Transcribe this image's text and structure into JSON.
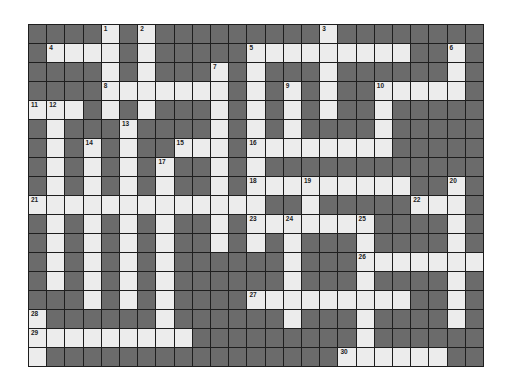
{
  "puzzle": {
    "columns": 25,
    "rows": 18,
    "colors": {
      "block": "#6b6b6b",
      "open": "#ececec",
      "line": "#1e1e1e",
      "number": "#222222"
    },
    "open_cells": [
      [
        4,
        6,
        16
      ],
      [
        1,
        2,
        3,
        4,
        6,
        12,
        13,
        14,
        15,
        16,
        17,
        18,
        19,
        20,
        23
      ],
      [
        4,
        6,
        10,
        12,
        16,
        23
      ],
      [
        4,
        5,
        6,
        7,
        8,
        9,
        10,
        12,
        14,
        16,
        19,
        20,
        21,
        22,
        23
      ],
      [
        0,
        1,
        2,
        4,
        6,
        10,
        12,
        14,
        16,
        19
      ],
      [
        1,
        5,
        10,
        12,
        14,
        19
      ],
      [
        1,
        3,
        5,
        8,
        9,
        10,
        12,
        13,
        14,
        15,
        16,
        17,
        18,
        19
      ],
      [
        1,
        3,
        5,
        7,
        10,
        12
      ],
      [
        1,
        3,
        5,
        7,
        10,
        12,
        13,
        14,
        15,
        16,
        17,
        18,
        19,
        20,
        23
      ],
      [
        0,
        1,
        2,
        3,
        4,
        5,
        6,
        7,
        8,
        9,
        10,
        11,
        12,
        15,
        21,
        22,
        23
      ],
      [
        1,
        3,
        5,
        7,
        10,
        12,
        13,
        14,
        15,
        16,
        17,
        18,
        23
      ],
      [
        1,
        3,
        5,
        7,
        10,
        12,
        14,
        18,
        23
      ],
      [
        1,
        3,
        5,
        7,
        14,
        18,
        19,
        20,
        21,
        22,
        23,
        24
      ],
      [
        1,
        3,
        5,
        7,
        14,
        18,
        23
      ],
      [
        3,
        5,
        7,
        12,
        13,
        14,
        15,
        16,
        17,
        18,
        19,
        20,
        23
      ],
      [
        0,
        7,
        14,
        18,
        23
      ],
      [
        0,
        1,
        2,
        3,
        4,
        5,
        6,
        7,
        8,
        18
      ],
      [
        0,
        17,
        18,
        19,
        20,
        21,
        22
      ]
    ],
    "numbers": [
      {
        "n": "1",
        "r": 0,
        "c": 4
      },
      {
        "n": "2",
        "r": 0,
        "c": 6
      },
      {
        "n": "3",
        "r": 0,
        "c": 16
      },
      {
        "n": "4",
        "r": 1,
        "c": 1
      },
      {
        "n": "5",
        "r": 1,
        "c": 12
      },
      {
        "n": "6",
        "r": 1,
        "c": 23
      },
      {
        "n": "7",
        "r": 2,
        "c": 10
      },
      {
        "n": "8",
        "r": 3,
        "c": 4
      },
      {
        "n": "9",
        "r": 3,
        "c": 14
      },
      {
        "n": "10",
        "r": 3,
        "c": 19
      },
      {
        "n": "11",
        "r": 4,
        "c": 0
      },
      {
        "n": "12",
        "r": 4,
        "c": 1
      },
      {
        "n": "13",
        "r": 5,
        "c": 5
      },
      {
        "n": "14",
        "r": 6,
        "c": 3
      },
      {
        "n": "15",
        "r": 6,
        "c": 8
      },
      {
        "n": "16",
        "r": 6,
        "c": 12
      },
      {
        "n": "17",
        "r": 7,
        "c": 7
      },
      {
        "n": "18",
        "r": 8,
        "c": 12
      },
      {
        "n": "19",
        "r": 8,
        "c": 15
      },
      {
        "n": "20",
        "r": 8,
        "c": 23
      },
      {
        "n": "21",
        "r": 9,
        "c": 0
      },
      {
        "n": "22",
        "r": 9,
        "c": 21
      },
      {
        "n": "23",
        "r": 10,
        "c": 12
      },
      {
        "n": "24",
        "r": 10,
        "c": 14
      },
      {
        "n": "25",
        "r": 10,
        "c": 18
      },
      {
        "n": "26",
        "r": 12,
        "c": 18
      },
      {
        "n": "27",
        "r": 14,
        "c": 12
      },
      {
        "n": "28",
        "r": 15,
        "c": 0
      },
      {
        "n": "29",
        "r": 16,
        "c": 0
      },
      {
        "n": "30",
        "r": 17,
        "c": 17
      }
    ]
  }
}
